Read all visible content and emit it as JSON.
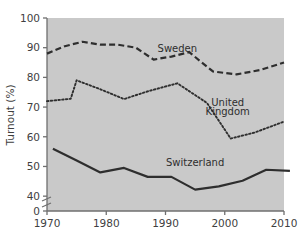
{
  "figure": {
    "clipped_header_text": "Voter turnout in national elections",
    "plot_background_color": "#c9c9c9",
    "page_background_color": "#ffffff",
    "axis_color": "#6f6f6f",
    "line_color": "#2e2e2e"
  },
  "chart_data": {
    "type": "line",
    "title": "",
    "xlabel": "",
    "ylabel": "Turnout (%)",
    "xlim": [
      1970,
      2010
    ],
    "ylim": [
      35,
      100
    ],
    "y_axis_break": true,
    "y_break_from": 0,
    "y_break_to": 40,
    "grid": false,
    "legend": "inline-labels",
    "xticks": [
      1970,
      1980,
      1990,
      2000,
      2010
    ],
    "xtick_labels": [
      "1970",
      "1980",
      "1990",
      "2000",
      "2010"
    ],
    "yticks": [
      0,
      40,
      50,
      60,
      70,
      80,
      90,
      100
    ],
    "ytick_labels": [
      "0",
      "40",
      "50",
      "60",
      "70",
      "80",
      "90",
      "100"
    ],
    "series": [
      {
        "name": "Sweden",
        "style": "dashed",
        "label_x": 1992,
        "label_y": 88.5,
        "x": [
          1970,
          1973,
          1976,
          1979,
          1982,
          1985,
          1988,
          1991,
          1994,
          1998,
          2002,
          2006,
          2010
        ],
        "values": [
          88.0,
          90.5,
          92.0,
          91.0,
          91.0,
          90.0,
          86.0,
          87.0,
          88.5,
          82.0,
          81.0,
          82.5,
          85.0
        ]
      },
      {
        "name": "United Kingdom",
        "style": "dotted",
        "label_x": 2000,
        "label_y": 69.5,
        "x": [
          1970,
          1974,
          1975,
          1979,
          1983,
          1987,
          1992,
          1997,
          2001,
          2005,
          2010
        ],
        "values": [
          72.0,
          72.8,
          79.0,
          76.0,
          72.7,
          75.3,
          78.0,
          71.4,
          59.4,
          61.4,
          65.1
        ]
      },
      {
        "name": "Switzerland",
        "style": "solid",
        "label_x": 1995,
        "label_y": 50.5,
        "x": [
          1971,
          1975,
          1979,
          1983,
          1987,
          1991,
          1995,
          1999,
          2003,
          2007,
          2011
        ],
        "values": [
          56.0,
          52.0,
          48.0,
          49.5,
          46.5,
          46.5,
          42.2,
          43.3,
          45.2,
          48.9,
          48.5
        ]
      }
    ]
  },
  "series_labels": {
    "sweden": "Sweden",
    "united_kingdom_line1": "United",
    "united_kingdom_line2": "Kingdom",
    "switzerland": "Switzerland"
  },
  "axis": {
    "y_title": "Turnout (%)"
  }
}
